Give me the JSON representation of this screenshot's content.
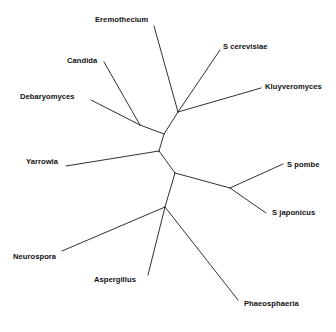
{
  "figure": {
    "type": "unrooted-phylogenetic-tree",
    "width": 336,
    "height": 332,
    "background_color": "#ffffff",
    "line_color": "#1a1a1a",
    "text_color": "#111111"
  },
  "taxa": [
    {
      "name": "Eremothecium",
      "label": "Eremothecium",
      "x": 95,
      "y": 15,
      "anchor": "start"
    },
    {
      "name": "S cerevisiae",
      "label": "S cerevisiae",
      "x": 223,
      "y": 42,
      "anchor": "start"
    },
    {
      "name": "Candida",
      "label": "Candida",
      "x": 67,
      "y": 56,
      "anchor": "start"
    },
    {
      "name": "Kluyveromyces",
      "label": "Kluyveromyces",
      "x": 265,
      "y": 82,
      "anchor": "start"
    },
    {
      "name": "Debaryomyces",
      "label": "Debaryomyces",
      "x": 20,
      "y": 92,
      "anchor": "start"
    },
    {
      "name": "Yarrowia",
      "label": "Yarrowia",
      "x": 26,
      "y": 157,
      "anchor": "start"
    },
    {
      "name": "S pombe",
      "label": "S pombe",
      "x": 287,
      "y": 160,
      "anchor": "start"
    },
    {
      "name": "S japonicus",
      "label": "S japonicus",
      "x": 272,
      "y": 208,
      "anchor": "start"
    },
    {
      "name": "Neurospora",
      "label": "Neurospora",
      "x": 13,
      "y": 252,
      "anchor": "start"
    },
    {
      "name": "Aspergillus",
      "label": "Aspergillus",
      "x": 94,
      "y": 275,
      "anchor": "start"
    },
    {
      "name": "Phaeosphaeria",
      "label": "Phaeosphaeria",
      "x": 244,
      "y": 299,
      "anchor": "start"
    }
  ],
  "nodes": {
    "center_left": {
      "x": 159,
      "y": 151
    },
    "center_right": {
      "x": 175,
      "y": 173
    },
    "yeast_upper": {
      "x": 178,
      "y": 112
    },
    "candida_deb": {
      "x": 140,
      "y": 125
    },
    "schizo": {
      "x": 230,
      "y": 188
    },
    "filamentous": {
      "x": 165,
      "y": 207
    }
  },
  "branches": [
    {
      "name": "internal-center-spine",
      "points": "159,151 175,173"
    },
    {
      "name": "internal-center-to-yeast",
      "points": "159,151 164,134 178,112"
    },
    {
      "name": "internal-yeast-to-candidadeb",
      "points": "164,134 140,125"
    },
    {
      "name": "tip-candida",
      "points": "140,125 104,62"
    },
    {
      "name": "tip-debaryomyces",
      "points": "140,125 91,100"
    },
    {
      "name": "tip-eremothecium",
      "points": "178,112 154,26"
    },
    {
      "name": "tip-s-cerevisiae",
      "points": "178,112 220,50"
    },
    {
      "name": "tip-kluyveromyces",
      "points": "178,112 261,88"
    },
    {
      "name": "tip-yarrowia",
      "points": "159,151 66,166"
    },
    {
      "name": "internal-right-to-schizo",
      "points": "175,173 230,188"
    },
    {
      "name": "tip-s-pombe",
      "points": "230,188 283,164"
    },
    {
      "name": "tip-s-japonicus",
      "points": "230,188 266,213"
    },
    {
      "name": "internal-right-to-filament",
      "points": "175,173 165,207"
    },
    {
      "name": "tip-neurospora",
      "points": "165,207 62,251"
    },
    {
      "name": "tip-aspergillus",
      "points": "165,207 148,275"
    },
    {
      "name": "tip-phaeosphaeria",
      "points": "165,207 238,300"
    }
  ]
}
